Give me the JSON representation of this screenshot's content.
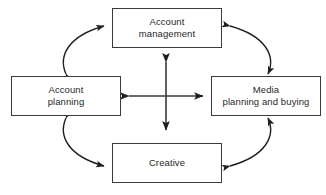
{
  "diagram": {
    "type": "cycle-diagram",
    "title": "",
    "stroke_color": "#3a3a3a",
    "text_color": "#1f1f1f",
    "background_color": "#ffffff",
    "nodes": [
      {
        "id": "account-management",
        "label": "Account\nmanagement",
        "position": "top"
      },
      {
        "id": "account-planning",
        "label": "Account\nplanning",
        "position": "left"
      },
      {
        "id": "media-planning",
        "label": "Media\nplanning and buying",
        "position": "right"
      },
      {
        "id": "creative",
        "label": "Creative",
        "position": "bottom"
      }
    ],
    "curved_connectors": [
      {
        "id": "account-management-to-account-planning",
        "from": "account-planning",
        "to": "account-management",
        "corner": "top-left",
        "arrowheads": "both"
      },
      {
        "id": "account-management-to-media-planning",
        "from": "account-management",
        "to": "media-planning",
        "corner": "top-right",
        "arrowheads": "both"
      },
      {
        "id": "account-planning-to-creative",
        "from": "creative",
        "to": "account-planning",
        "corner": "bottom-left",
        "arrowheads": "both"
      },
      {
        "id": "media-planning-to-creative",
        "from": "media-planning",
        "to": "creative",
        "corner": "bottom-right",
        "arrowheads": "both"
      }
    ],
    "center_cross": {
      "id": "center-cross-arrows",
      "description": "four-headed cross arrow linking all four nodes",
      "arrowheads": [
        "up",
        "down",
        "left",
        "right"
      ],
      "center_x": 166,
      "center_y": 96
    }
  }
}
